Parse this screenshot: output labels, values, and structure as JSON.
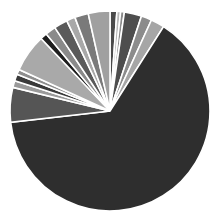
{
  "chart_data": {
    "type": "pie",
    "title": "",
    "legend": "none",
    "start_angle_deg": 0,
    "direction": "clockwise",
    "center": [
      110,
      111
    ],
    "radius": 100,
    "slices": [
      {
        "label": "",
        "value": 1.1,
        "color": "#4a4a4a"
      },
      {
        "label": "",
        "value": 0.6,
        "color": "#b8b8b8"
      },
      {
        "label": "",
        "value": 0.6,
        "color": "#8a8a8a"
      },
      {
        "label": "",
        "value": 2.8,
        "color": "#4e4e4e"
      },
      {
        "label": "",
        "value": 1.7,
        "color": "#8c8c8c"
      },
      {
        "label": "",
        "value": 2.2,
        "color": "#a6a6a6"
      },
      {
        "label": "",
        "value": 64.2,
        "color": "#2e2e2e"
      },
      {
        "label": "",
        "value": 5.6,
        "color": "#555555"
      },
      {
        "label": "",
        "value": 1.1,
        "color": "#9a9a9a"
      },
      {
        "label": "",
        "value": 1.1,
        "color": "#3a3a3a"
      },
      {
        "label": "",
        "value": 0.8,
        "color": "#8e8e8e"
      },
      {
        "label": "",
        "value": 6.1,
        "color": "#a9a9a9"
      },
      {
        "label": "",
        "value": 1.1,
        "color": "#1e1e1e"
      },
      {
        "label": "",
        "value": 1.7,
        "color": "#8a8a8a"
      },
      {
        "label": "",
        "value": 2.2,
        "color": "#5a5a5a"
      },
      {
        "label": "",
        "value": 1.4,
        "color": "#a8a8a8"
      },
      {
        "label": "",
        "value": 2.2,
        "color": "#7a7a7a"
      },
      {
        "label": "",
        "value": 3.5,
        "color": "#a0a0a0"
      }
    ]
  }
}
